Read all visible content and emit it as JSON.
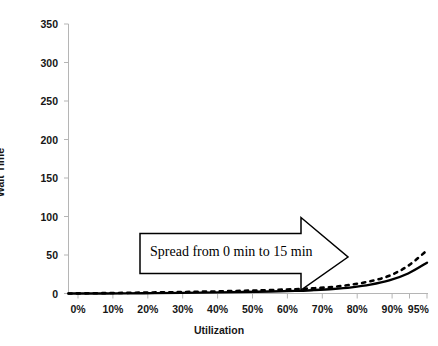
{
  "chart_data": {
    "type": "line",
    "title": "",
    "subtitle": "",
    "xlabel": "Utilization",
    "ylabel": "Wait Time",
    "grid": false,
    "legend": "none",
    "xlim": [
      0,
      95
    ],
    "ylim": [
      0,
      350
    ],
    "x_tick_labels": [
      "0%",
      "10%",
      "20%",
      "30%",
      "40%",
      "50%",
      "60%",
      "70%",
      "80%",
      "90%",
      "95%"
    ],
    "x_tick_values": [
      0,
      10,
      20,
      30,
      40,
      50,
      60,
      70,
      80,
      90,
      95
    ],
    "y_tick_labels": [
      "0",
      "50",
      "100",
      "150",
      "200",
      "250",
      "300",
      "350"
    ],
    "y_tick_values": [
      0,
      50,
      100,
      150,
      200,
      250,
      300,
      350
    ],
    "x": [
      0,
      10,
      20,
      30,
      40,
      50,
      60,
      65,
      70,
      75,
      80,
      85,
      90,
      95
    ],
    "series": [
      {
        "name": "solid-curve",
        "style": "solid",
        "color": "#000000",
        "values": [
          0,
          0,
          0.4,
          0.8,
          1.4,
          2.2,
          3.4,
          4.4,
          5.8,
          8.0,
          11.5,
          17.0,
          26.0,
          40.0
        ]
      },
      {
        "name": "dashed-curve",
        "style": "dashed",
        "color": "#000000",
        "values": [
          0,
          0.5,
          1.2,
          1.9,
          2.8,
          4.0,
          5.6,
          6.8,
          8.6,
          11.5,
          16.0,
          23.0,
          36.0,
          56.0
        ]
      }
    ],
    "annotations": [
      {
        "name": "spread-callout",
        "shape": "right-block-arrow",
        "text": "Spread from 0 min to 15 min",
        "x_range": [
          18,
          76
        ],
        "y_center": 58
      }
    ],
    "colors": {
      "axis": "#b0b0b0",
      "line": "#000000",
      "text": "#161616",
      "background": "#ffffff",
      "callout_outline": "#000000"
    }
  }
}
